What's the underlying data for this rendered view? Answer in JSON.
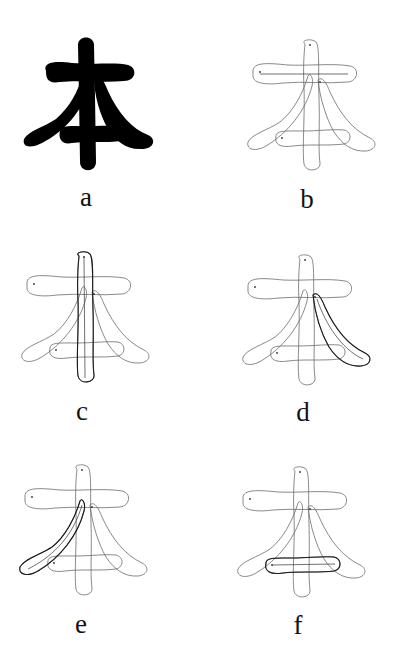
{
  "figure": {
    "character": "本",
    "panels": [
      {
        "id": "a",
        "label": "a",
        "kind": "solid-glyph",
        "highlight": "none"
      },
      {
        "id": "b",
        "label": "b",
        "kind": "stroke-outline",
        "highlight": "horizontal-top"
      },
      {
        "id": "c",
        "label": "c",
        "kind": "stroke-outline",
        "highlight": "vertical"
      },
      {
        "id": "d",
        "label": "d",
        "kind": "stroke-outline",
        "highlight": "right-falling"
      },
      {
        "id": "e",
        "label": "e",
        "kind": "stroke-outline",
        "highlight": "left-falling"
      },
      {
        "id": "f",
        "label": "f",
        "kind": "stroke-outline",
        "highlight": "horizontal-bottom"
      }
    ]
  },
  "colors": {
    "background": "#ffffff",
    "ink": "#000000",
    "outline": "#6b6b6b"
  }
}
